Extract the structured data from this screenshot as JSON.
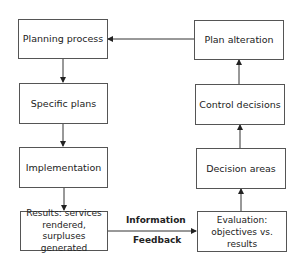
{
  "diagram": {
    "type": "flowchart",
    "left_column": [
      {
        "id": "planning",
        "label": "Planning process"
      },
      {
        "id": "specific",
        "label": "Specific plans"
      },
      {
        "id": "implementation",
        "label": "Implementation"
      },
      {
        "id": "results",
        "label": "Results: services rendered, surpluses generated"
      }
    ],
    "right_column": [
      {
        "id": "alteration",
        "label": "Plan alteration"
      },
      {
        "id": "control",
        "label": "Control decisions"
      },
      {
        "id": "decision_areas",
        "label": "Decision areas"
      },
      {
        "id": "evaluation",
        "label": "Evaluation: objectives vs. results"
      }
    ],
    "connector": {
      "top_label": "Information",
      "bottom_label": "Feedback"
    },
    "edges": [
      [
        "planning",
        "specific"
      ],
      [
        "specific",
        "implementation"
      ],
      [
        "implementation",
        "results"
      ],
      [
        "results",
        "evaluation"
      ],
      [
        "evaluation",
        "decision_areas"
      ],
      [
        "decision_areas",
        "control"
      ],
      [
        "control",
        "alteration"
      ],
      [
        "alteration",
        "planning"
      ]
    ]
  }
}
